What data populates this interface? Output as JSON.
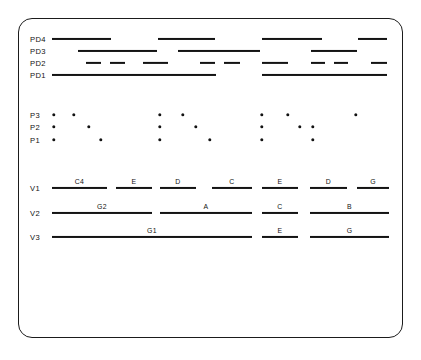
{
  "figure": {
    "title": "",
    "line_color": "#131313",
    "background_color": "#ffffff",
    "border_color": "#1b1b1b"
  },
  "chart_data": {
    "type": "table",
    "title": "",
    "xlabel": "",
    "ylabel": "",
    "rows": [
      {
        "label": "PD4",
        "kind": "bars",
        "y": 39,
        "segments": [
          {
            "x1": 52,
            "x2": 111
          },
          {
            "x1": 158,
            "x2": 215
          },
          {
            "x1": 262,
            "x2": 322
          },
          {
            "x1": 358,
            "x2": 387
          }
        ]
      },
      {
        "label": "PD3",
        "kind": "bars",
        "y": 51,
        "segments": [
          {
            "x1": 78,
            "x2": 157
          },
          {
            "x1": 178,
            "x2": 260
          },
          {
            "x1": 311,
            "x2": 357
          }
        ]
      },
      {
        "label": "PD2",
        "kind": "bars",
        "y": 63,
        "segments": [
          {
            "x1": 86,
            "x2": 101
          },
          {
            "x1": 110,
            "x2": 125
          },
          {
            "x1": 143,
            "x2": 168
          },
          {
            "x1": 200,
            "x2": 215
          },
          {
            "x1": 224,
            "x2": 240
          },
          {
            "x1": 262,
            "x2": 288
          },
          {
            "x1": 311,
            "x2": 325
          },
          {
            "x1": 334,
            "x2": 348
          },
          {
            "x1": 371,
            "x2": 387
          }
        ]
      },
      {
        "label": "PD1",
        "kind": "bars",
        "y": 75,
        "segments": [
          {
            "x1": 52,
            "x2": 216
          },
          {
            "x1": 262,
            "x2": 387
          }
        ]
      },
      {
        "label": "P3",
        "kind": "dots",
        "y": 115,
        "points": [
          54,
          74,
          160,
          183,
          262,
          288,
          356
        ]
      },
      {
        "label": "P2",
        "kind": "dots",
        "y": 127,
        "points": [
          54,
          89,
          160,
          196,
          262,
          300,
          313
        ]
      },
      {
        "label": "P1",
        "kind": "dots",
        "y": 140,
        "points": [
          54,
          101,
          160,
          210,
          262,
          313
        ]
      },
      {
        "label": "V1",
        "kind": "labeled",
        "y": 188,
        "segments": [
          {
            "x1": 52,
            "x2": 107,
            "text": "C4"
          },
          {
            "x1": 116,
            "x2": 152,
            "text": "E"
          },
          {
            "x1": 160,
            "x2": 196,
            "text": "D"
          },
          {
            "x1": 212,
            "x2": 252,
            "text": "C"
          },
          {
            "x1": 262,
            "x2": 298,
            "text": "E"
          },
          {
            "x1": 310,
            "x2": 347,
            "text": "D"
          },
          {
            "x1": 357,
            "x2": 389,
            "text": "G"
          }
        ]
      },
      {
        "label": "V2",
        "kind": "labeled",
        "y": 213,
        "segments": [
          {
            "x1": 52,
            "x2": 152,
            "text": "G2"
          },
          {
            "x1": 160,
            "x2": 252,
            "text": "A"
          },
          {
            "x1": 262,
            "x2": 298,
            "text": "C"
          },
          {
            "x1": 310,
            "x2": 389,
            "text": "B"
          }
        ]
      },
      {
        "label": "V3",
        "kind": "labeled",
        "y": 237,
        "segments": [
          {
            "x1": 52,
            "x2": 252,
            "text": "G1"
          },
          {
            "x1": 262,
            "x2": 298,
            "text": "E"
          },
          {
            "x1": 310,
            "x2": 389,
            "text": "G"
          }
        ]
      }
    ],
    "label_x": 30,
    "bar_thickness": 2.1,
    "thin_bar_thickness": 1.6
  }
}
